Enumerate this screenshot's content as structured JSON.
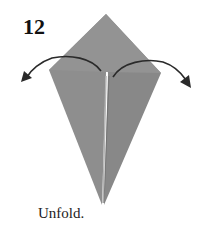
{
  "step": {
    "number": "12",
    "caption": "Unfold."
  },
  "diagram": {
    "paper_color": "#8c8c8c",
    "paper_color_light": "#9a9a9a",
    "crease_color": "#b8b8b8",
    "arrow_color": "#2a2a2a",
    "arrows": [
      {
        "name": "unfold-left-arrow",
        "direction": "left"
      },
      {
        "name": "unfold-right-arrow",
        "direction": "right"
      }
    ]
  }
}
